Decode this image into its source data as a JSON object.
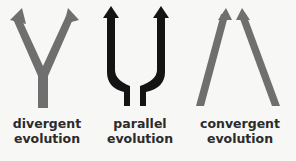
{
  "diagram": {
    "colors": {
      "gray": "#6f6f6f",
      "black": "#141414",
      "background": "#f7f7f5",
      "text": "#2b2b2b"
    },
    "items": [
      {
        "id": "divergent",
        "line1": "divergent",
        "line2": "evolution",
        "shape": "Y-shaped arrow, one stem splitting into two diverging arrows",
        "color": "gray"
      },
      {
        "id": "parallel",
        "line1": "parallel",
        "line2": "evolution",
        "shape": "U-shaped fork with two parallel upward arrows",
        "color": "black"
      },
      {
        "id": "convergent",
        "line1": "convergent",
        "line2": "evolution",
        "shape": "two arrows converging toward each other",
        "color": "gray"
      }
    ]
  }
}
